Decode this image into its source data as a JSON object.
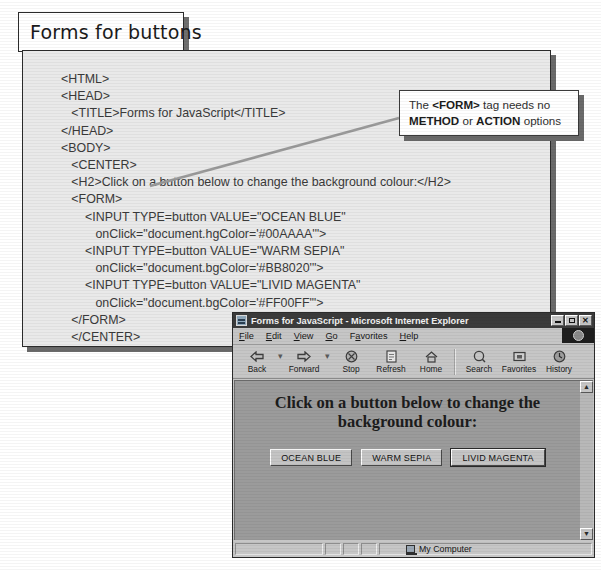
{
  "figure": {
    "title_banner": "Forms for buttons"
  },
  "code_listing": {
    "lines": [
      "<HTML>",
      "<HEAD>",
      "   <TITLE>Forms for JavaScript</TITLE>",
      "</HEAD>",
      "<BODY>",
      "   <CENTER>",
      "   <H2>Click on a button below to change the background colour:</H2>",
      "   <FORM>",
      "       <INPUT TYPE=button VALUE=\"OCEAN BLUE\"",
      "          onClick=\"document.hgColor='#00AAAA'\">",
      "       <INPUT TYPE=button VALUE=\"WARM SEPIA\"",
      "          onClick=\"document.bgColor='#BB8020'\">",
      "       <INPUT TYPE=button VALUE=\"LIVID MAGENTA\"",
      "          onClick=\"document.bgColor='#FF00FF'\">",
      "   </FORM>",
      "   </CENTER>",
      "</BODY>",
      "</HTML>"
    ]
  },
  "callout": {
    "line1_pre": "The ",
    "line1_tag": "<FORM>",
    "line1_post": " tag needs no",
    "line2_a": "METHOD",
    "line2_mid": " or ",
    "line2_b": "ACTION",
    "line2_post": " options"
  },
  "browser": {
    "window_title": "Forms for JavaScript - Microsoft Internet Explorer",
    "titlebar_buttons": {
      "minimize": "_",
      "maximize": "□",
      "close": "✕"
    },
    "menu": [
      {
        "label": "File",
        "accel": "F"
      },
      {
        "label": "Edit",
        "accel": "E"
      },
      {
        "label": "View",
        "accel": "V"
      },
      {
        "label": "Go",
        "accel": "G"
      },
      {
        "label": "Favorites",
        "accel": "a"
      },
      {
        "label": "Help",
        "accel": "H"
      }
    ],
    "toolbar": [
      {
        "label": "Back",
        "icon": "back-arrow-icon",
        "glyph": "⇦"
      },
      {
        "label": "Forward",
        "icon": "forward-arrow-icon",
        "glyph": "⇨"
      },
      {
        "label": "Stop",
        "icon": "stop-icon",
        "glyph": "⊗"
      },
      {
        "label": "Refresh",
        "icon": "refresh-icon",
        "glyph": "🗎"
      },
      {
        "label": "Home",
        "icon": "home-icon",
        "glyph": "⌂"
      },
      {
        "label": "Search",
        "icon": "search-icon",
        "glyph": "⌕"
      },
      {
        "label": "Favorites",
        "icon": "favorites-icon",
        "glyph": "▣"
      },
      {
        "label": "History",
        "icon": "history-icon",
        "glyph": "◕"
      }
    ],
    "page": {
      "heading_line1": "Click on a button below to change the",
      "heading_line2": "background colour:",
      "buttons": [
        {
          "label": "OCEAN BLUE",
          "focused": false
        },
        {
          "label": "WARM SEPIA",
          "focused": false
        },
        {
          "label": "LIVID MAGENTA",
          "focused": true
        }
      ],
      "background_color": "#9b9b9b"
    },
    "scrollbar": {
      "up_glyph": "▲",
      "down_glyph": "▼"
    },
    "statusbar": {
      "zone_label": "My Computer"
    }
  },
  "colors": {
    "panel_background": "#e9e9e9",
    "code_text": "#3a3a3a",
    "window_chrome": "#c6c6c6",
    "titlebar": "#3b3b3b",
    "page_background": "#9b9b9b"
  }
}
